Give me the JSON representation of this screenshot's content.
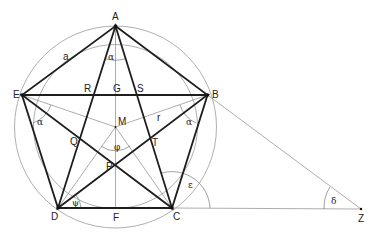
{
  "diagram": {
    "colors": {
      "thick_line": "#1e1e1e",
      "thin_line": "#8a8a8a",
      "circle": "#9a9a9a",
      "background": "#ffffff"
    },
    "points": {
      "A": {
        "label": "A",
        "x": 115.5,
        "y": 26
      },
      "B": {
        "label": "B",
        "x": 207.5,
        "y": 95
      },
      "C": {
        "label": "C",
        "x": 172,
        "y": 208
      },
      "D": {
        "label": "D",
        "x": 58,
        "y": 208
      },
      "E": {
        "label": "E",
        "x": 22,
        "y": 95
      },
      "F": {
        "label": "F",
        "x": 115.5,
        "y": 208
      },
      "G": {
        "label": "G",
        "x": 115.5,
        "y": 95
      },
      "M": {
        "label": "M",
        "x": 115.5,
        "y": 127
      },
      "P": {
        "label": "P",
        "x": 115.5,
        "y": 165
      },
      "Q": {
        "label": "Q",
        "x": 84,
        "y": 143
      },
      "R": {
        "label": "R",
        "x": 92,
        "y": 95
      },
      "S": {
        "label": "S",
        "x": 138,
        "y": 95
      },
      "T": {
        "label": "T",
        "x": 151,
        "y": 140
      },
      "Z": {
        "label": "Z",
        "x": 361,
        "y": 209
      }
    },
    "segment_labels": {
      "a": "a",
      "r": "r"
    },
    "angle_labels": {
      "alpha_A": "α",
      "alpha_E": "α",
      "alpha_B": "α",
      "phi": "φ",
      "psi": "ψ",
      "epsilon": "ε",
      "delta": "δ"
    },
    "circles": [
      {
        "name": "circumcircle",
        "cx": 115.5,
        "cy": 127,
        "r": 101
      },
      {
        "name": "inner-circle",
        "cx": 115.5,
        "cy": 126.5,
        "r": 82
      }
    ]
  }
}
